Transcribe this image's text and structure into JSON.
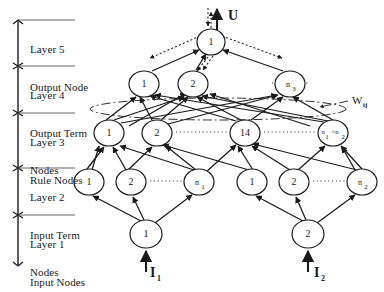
{
  "figure": {
    "background": "#ffffff",
    "ink": "#1a1a1a"
  },
  "axis": {
    "name": "layer-bracket-axis",
    "x": 18,
    "top": 20,
    "bottom": 266,
    "separators": [
      20,
      66,
      113,
      168,
      215
    ]
  },
  "layers": [
    {
      "id": "layer5",
      "label_line1": "Layer 5",
      "label_line2": "Output Node",
      "label_x": 30,
      "label_y": 24,
      "rule_y": 20,
      "rule_x2": 75
    },
    {
      "id": "layer4",
      "label_line1": "Layer 4",
      "label_line2": "Output Term",
      "label_line3": "Nodes",
      "label_x": 30,
      "label_y": 70,
      "rule_y": 66,
      "rule_x2": 75
    },
    {
      "id": "layer3",
      "label_line1": "Layer 3",
      "label_line2": "Rule Nodes",
      "label_x": 30,
      "label_y": 117,
      "rule_y": 113,
      "rule_x2": 75
    },
    {
      "id": "layer2",
      "label_line1": "Layer 2",
      "label_line2": "Input Term",
      "label_line3": "Nodes",
      "label_x": 30,
      "label_y": 172,
      "rule_y": 168,
      "rule_x2": 75
    },
    {
      "id": "layer1",
      "label_line1": "Layer 1",
      "label_line2": "Input Nodes",
      "label_x": 30,
      "label_y": 219,
      "rule_y": 215,
      "rule_x2": 75
    }
  ],
  "nodes": {
    "layer5": [
      {
        "id": "L5-1",
        "label": "1",
        "x": 211,
        "y": 42,
        "rx": 14,
        "ry": 13,
        "size": "normal"
      }
    ],
    "layer4": [
      {
        "id": "L4-1",
        "label": "1",
        "x": 144,
        "y": 84,
        "rx": 15,
        "ry": 13,
        "size": "normal"
      },
      {
        "id": "L4-2",
        "label": "2",
        "x": 193,
        "y": 84,
        "rx": 15,
        "ry": 13,
        "size": "normal"
      },
      {
        "id": "L4-n3",
        "label": "n",
        "sub": "3",
        "x": 290,
        "y": 84,
        "rx": 15,
        "ry": 13,
        "size": "sm"
      }
    ],
    "layer3": [
      {
        "id": "L3-1",
        "label": "1",
        "x": 109,
        "y": 133,
        "rx": 15,
        "ry": 13,
        "size": "normal"
      },
      {
        "id": "L3-2",
        "label": "2",
        "x": 157,
        "y": 133,
        "rx": 15,
        "ry": 13,
        "size": "normal"
      },
      {
        "id": "L3-14",
        "label": "14",
        "x": 245,
        "y": 133,
        "rx": 15,
        "ry": 13,
        "size": "normal"
      },
      {
        "id": "L3-n1n2",
        "label": "n",
        "sub": "1",
        "mid": "×n",
        "sub2": "2",
        "x": 333,
        "y": 133,
        "rx": 15,
        "ry": 13,
        "size": "xs"
      }
    ],
    "layer2": [
      {
        "id": "L2a-1",
        "label": "1",
        "x": 89,
        "y": 182,
        "rx": 15,
        "ry": 13,
        "size": "normal"
      },
      {
        "id": "L2a-2",
        "label": "2",
        "x": 131,
        "y": 182,
        "rx": 15,
        "ry": 13,
        "size": "normal"
      },
      {
        "id": "L2a-n1",
        "label": "n",
        "sub": "1",
        "x": 199,
        "y": 182,
        "rx": 15,
        "ry": 13,
        "size": "sm"
      },
      {
        "id": "L2b-1",
        "label": "1",
        "x": 252,
        "y": 182,
        "rx": 15,
        "ry": 13,
        "size": "normal"
      },
      {
        "id": "L2b-2",
        "label": "2",
        "x": 294,
        "y": 182,
        "rx": 15,
        "ry": 13,
        "size": "normal"
      },
      {
        "id": "L2b-n2",
        "label": "n",
        "sub": "2",
        "x": 362,
        "y": 182,
        "rx": 15,
        "ry": 13,
        "size": "sm"
      }
    ],
    "layer1": [
      {
        "id": "L1-1",
        "label": "1",
        "x": 146,
        "y": 234,
        "rx": 16,
        "ry": 14,
        "size": "normal"
      },
      {
        "id": "L1-2",
        "label": "2",
        "x": 308,
        "y": 234,
        "rx": 16,
        "ry": 14,
        "size": "normal"
      }
    ]
  },
  "annotations": [
    {
      "id": "output-U",
      "text": "U",
      "x": 228,
      "y": 17,
      "kind": "bold"
    },
    {
      "id": "input-I1",
      "text": "I",
      "sub": "1",
      "x": 152,
      "y": 275,
      "kind": "bold"
    },
    {
      "id": "input-I2",
      "text": "I",
      "sub": "2",
      "x": 316,
      "y": 275,
      "kind": "bold"
    },
    {
      "id": "weight-Wij",
      "text": "W",
      "sub": "ij",
      "x": 352,
      "y": 103,
      "kind": "weight"
    }
  ],
  "dotted_rows": [
    {
      "id": "dots-layer4",
      "x1": 308,
      "x2": 272,
      "y": 83
    },
    {
      "id": "dots-layer3-a",
      "x1": 176,
      "x2": 228,
      "y": 132
    },
    {
      "id": "dots-layer3-b",
      "x1": 264,
      "x2": 316,
      "y": 132
    },
    {
      "id": "dots-layer2-a",
      "x1": 150,
      "x2": 182,
      "y": 181
    },
    {
      "id": "dots-layer2-b",
      "x1": 313,
      "x2": 345,
      "y": 181
    }
  ],
  "weight_ellipse": {
    "id": "weight-region-ellipse",
    "cx": 218,
    "cy": 109,
    "rx": 128,
    "ry": 11
  },
  "legend_notes": {
    "forward_links": "solid arrows (feed-forward signal flow)",
    "backward_links": "dotted arrows (error back-propagation)"
  }
}
